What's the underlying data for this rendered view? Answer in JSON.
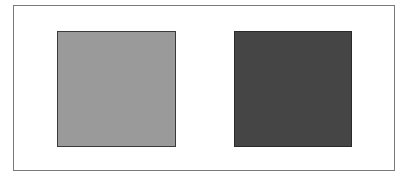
{
  "figure": {
    "frame": {
      "border_color": "#7a7a7a",
      "background": "#ffffff"
    },
    "squares": [
      {
        "name": "light-gray-square",
        "fill": "#9a9a9a",
        "border": "#3a3a3a"
      },
      {
        "name": "dark-gray-square",
        "fill": "#454545",
        "border": "#2a2a2a"
      }
    ]
  }
}
